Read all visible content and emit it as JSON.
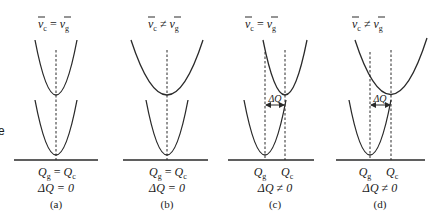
{
  "figure": {
    "edge_fragment": "e",
    "panels": [
      {
        "id": "a",
        "header": {
          "lhs": "v",
          "lhs_sub": "c",
          "op": "=",
          "rhs": "v",
          "rhs_sub": "g"
        },
        "q_label": {
          "text": "Q",
          "sub": "g",
          "op": "=",
          "text2": "Q",
          "sub2": "c"
        },
        "delta_label": "ΔQ = 0",
        "caption": "(a)"
      },
      {
        "id": "b",
        "header": {
          "lhs": "v",
          "lhs_sub": "c",
          "op": "≠",
          "rhs": "v",
          "rhs_sub": "g"
        },
        "q_label": {
          "text": "Q",
          "sub": "g",
          "op": "=",
          "text2": "Q",
          "sub2": "c"
        },
        "delta_label": "ΔQ = 0",
        "caption": "(b)"
      },
      {
        "id": "c",
        "header": {
          "lhs": "v",
          "lhs_sub": "c",
          "op": "=",
          "rhs": "v",
          "rhs_sub": "g"
        },
        "q_label": {
          "left": "Q",
          "left_sub": "g",
          "right": "Q",
          "right_sub": "c"
        },
        "arrow_label": "ΔQ",
        "delta_label": "ΔQ ≠ 0",
        "caption": "(c)"
      },
      {
        "id": "d",
        "header": {
          "lhs": "v",
          "lhs_sub": "c",
          "op": "≠",
          "rhs": "v",
          "rhs_sub": "g"
        },
        "q_label": {
          "left": "Q",
          "left_sub": "g",
          "right": "Q",
          "right_sub": "c"
        },
        "arrow_label": "ΔQ",
        "delta_label": "ΔQ ≠ 0",
        "caption": "(d)"
      }
    ]
  }
}
